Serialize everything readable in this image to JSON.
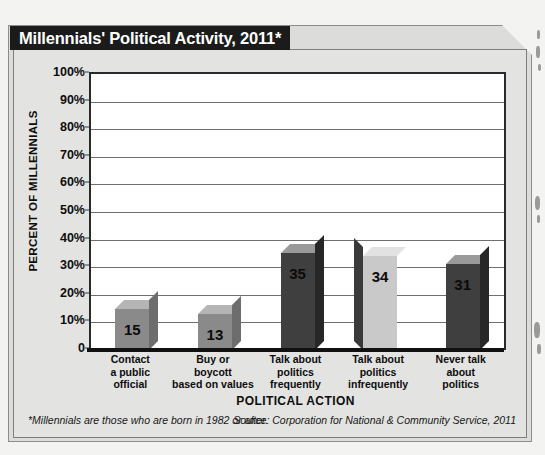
{
  "title": "Millennials' Political Activity, 2011*",
  "footnote": {
    "left": "*Millennials are those who are born in 1982 or after.",
    "right": "Source: Corporation for National & Community Service, 2011"
  },
  "colors": {
    "banner_bg": "#1b1b1b",
    "banner_text": "#ffffff",
    "frame_bg": "#dcdcda",
    "plot_bg": "#ffffff",
    "gridline": "#6f6f6f",
    "axis": "#111111",
    "bar_medium": "#8a8a8a",
    "bar_dark": "#3f3f3f",
    "bar_light": "#c9c9c9"
  },
  "chart_data": {
    "type": "bar",
    "title": "Millennials' Political Activity, 2011*",
    "xlabel": "POLITICAL ACTION",
    "ylabel": "PERCENT OF MILLENNIALS",
    "ylim": [
      0,
      100
    ],
    "ytick_labels": [
      "100%",
      "90%",
      "80%",
      "70%",
      "60%",
      "50%",
      "40%",
      "30%",
      "20%",
      "10%",
      "0"
    ],
    "ytick_values": [
      100,
      90,
      80,
      70,
      60,
      50,
      40,
      30,
      20,
      10,
      0
    ],
    "grid": true,
    "legend": "none",
    "categories": [
      "Contact\na public\nofficial",
      "Buy or\nboycott\nbased on values",
      "Talk about\npolitics\nfrequently",
      "Talk about\npolitics\ninfrequently",
      "Never talk\nabout\npolitics"
    ],
    "values": [
      15,
      13,
      35,
      34,
      31
    ],
    "data_labels": [
      "15",
      "13",
      "35",
      "34",
      "31"
    ],
    "bar_shades": [
      "medium",
      "medium",
      "dark",
      "light",
      "dark"
    ]
  }
}
